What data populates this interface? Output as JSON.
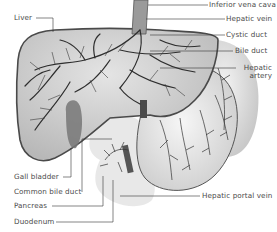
{
  "diagram": {
    "colors": {
      "organ_fill": "#d8d8d8",
      "organ_outline": "#555555",
      "vessel": "#3a3a3a",
      "stomach_fill": "#ececec",
      "label_text": "#4a4a4a",
      "leader_line": "#333333"
    },
    "labels_left": [
      {
        "id": "liver",
        "text": "Liver"
      },
      {
        "id": "gall-bladder",
        "text": "Gall bladder"
      },
      {
        "id": "common-bile-duct",
        "text": "Common bile duct"
      },
      {
        "id": "pancreas",
        "text": "Pancreas"
      },
      {
        "id": "duodenum",
        "text": "Duodenum"
      }
    ],
    "labels_right": [
      {
        "id": "inferior-vena-cava",
        "text": "Inferior vena cava"
      },
      {
        "id": "hepatic-vein",
        "text": "Hepatic vein"
      },
      {
        "id": "cystic-duct",
        "text": "Cystic duct"
      },
      {
        "id": "bile-duct",
        "text": "Bile duct"
      },
      {
        "id": "hepatic-artery",
        "text": "Hepatic\nartery"
      },
      {
        "id": "hepatic-portal-vein",
        "text": "Hepatic portal vein"
      }
    ],
    "hepatic_artery_line1": "Hepatic",
    "hepatic_artery_line2": "artery"
  }
}
